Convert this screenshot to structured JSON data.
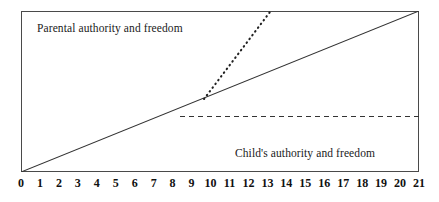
{
  "chart_data": {
    "type": "line",
    "title": "",
    "subtitle": "",
    "xlabel": "",
    "ylabel": "",
    "xlim": [
      0,
      21
    ],
    "ylim": [
      0,
      1
    ],
    "grid": false,
    "legend_position": "none",
    "xticks": [
      0,
      1,
      2,
      3,
      4,
      5,
      6,
      7,
      8,
      9,
      10,
      11,
      12,
      13,
      14,
      15,
      16,
      17,
      18,
      19,
      20,
      21
    ],
    "xtick_labels": [
      "0",
      "1",
      "2",
      "3",
      "4",
      "5",
      "6",
      "7",
      "8",
      "9",
      "10",
      "11",
      "12",
      "13",
      "14",
      "15",
      "16",
      "17",
      "18",
      "19",
      "20",
      "21"
    ],
    "annotations": [
      {
        "name": "parental-authority-label",
        "text": "Parental authority and freedom",
        "x": 0.85,
        "y": 0.93
      },
      {
        "name": "child-authority-label",
        "text": "Child's authority and freedom",
        "x": 11.3,
        "y": 0.16
      }
    ],
    "series": [
      {
        "name": "normal-transfer",
        "style": "solid",
        "color": "#333333",
        "x": [
          0,
          21
        ],
        "y": [
          0,
          1
        ]
      },
      {
        "name": "accelerated-transfer",
        "style": "dotted",
        "color": "#222222",
        "x": [
          11.5,
          14.2
        ],
        "y": [
          0.545,
          0.995
        ]
      },
      {
        "name": "arrested-transfer",
        "style": "dashed",
        "color": "#333333",
        "x": [
          10.0,
          21
        ],
        "y": [
          0.345,
          0.345
        ]
      }
    ]
  },
  "labels": {
    "parental": "Parental authority and freedom",
    "child": "Child's authority and freedom"
  }
}
